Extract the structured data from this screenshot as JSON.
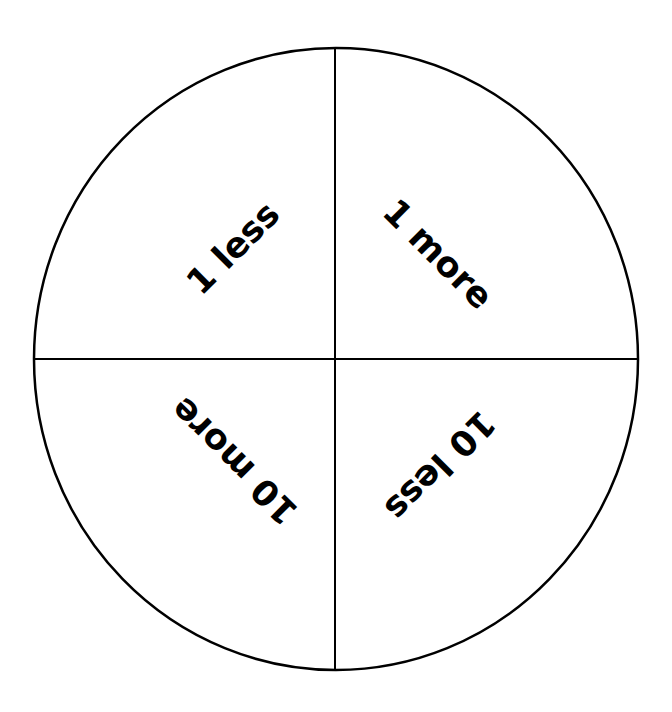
{
  "diagram": {
    "type": "four-quadrant circle spinner",
    "stroke_color": "#000000",
    "background_color": "#ffffff",
    "quadrants": [
      {
        "position": "top-left",
        "label": "1 less",
        "rotation_deg": -45
      },
      {
        "position": "top-right",
        "label": "1 more",
        "rotation_deg": 45
      },
      {
        "position": "bottom-left",
        "label": "10 more",
        "rotation_deg": 225
      },
      {
        "position": "bottom-right",
        "label": "10 less",
        "rotation_deg": 135
      }
    ]
  }
}
